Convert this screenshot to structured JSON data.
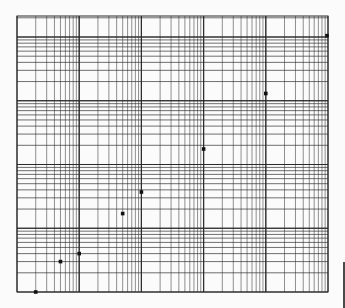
{
  "page": {
    "background": "#fbfbfb",
    "grid_color": "#2a2a2a",
    "point_color": "#111111"
  },
  "chart_data": {
    "type": "scatter",
    "title": "",
    "xlabel": "",
    "ylabel": "",
    "xscale": "log",
    "yscale": "log",
    "grid": true,
    "legend": null,
    "x_decades": 5,
    "xlim": [
      1,
      100000
    ],
    "ylim": [
      1,
      21000
    ],
    "tick_labels_visible": false,
    "series": [
      {
        "name": "points",
        "x": [
          2,
          5,
          10,
          50,
          100,
          1000,
          10000,
          100000
        ],
        "y": [
          1,
          3,
          4,
          17,
          37,
          175,
          1300,
          10500
        ]
      }
    ]
  }
}
